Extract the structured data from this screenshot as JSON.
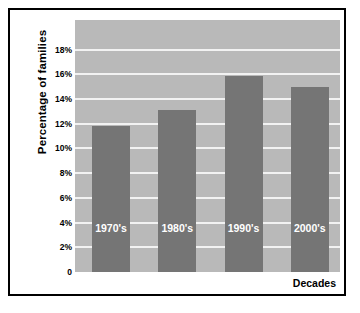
{
  "chart_data": {
    "type": "bar",
    "title": "",
    "subtitle": "",
    "xlabel": "Decades",
    "ylabel": "Percentage of families",
    "categories": [
      "1970's",
      "1980's",
      "1990's",
      "2000's"
    ],
    "values": [
      11.8,
      13.1,
      15.9,
      15.0
    ],
    "series": [
      {
        "name": "Percentage of families",
        "values": [
          11.8,
          13.1,
          15.9,
          15.0
        ]
      }
    ],
    "ylim": [
      0,
      20.4
    ],
    "ytick_values": [
      0,
      2,
      4,
      6,
      8,
      10,
      12,
      14,
      16,
      18
    ],
    "ytick_labels": [
      "0",
      "2%",
      "4%",
      "6%",
      "8%",
      "10%",
      "12%",
      "14%",
      "16%",
      "18%"
    ],
    "xtick_labels": [
      "1970's",
      "1980's",
      "1990's",
      "2000's"
    ],
    "bar_labels_inside": true,
    "grid": "horizontal",
    "legend": "none",
    "colors": {
      "bar_fill": "#757575",
      "plot_background": "#b9b9b9",
      "gridline": "#f2f2f2",
      "bar_label_text": "#ffffff",
      "axis_text": "#000000",
      "frame_border": "#000000",
      "figure_background": "#ffffff"
    }
  }
}
